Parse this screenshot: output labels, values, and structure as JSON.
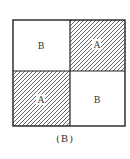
{
  "diagram": {
    "caption": "(B)",
    "cells": [
      {
        "position": "top-left",
        "label": "B",
        "hatched": false
      },
      {
        "position": "top-right",
        "label": "A",
        "hatched": true
      },
      {
        "position": "bottom-left",
        "label": "A",
        "hatched": true
      },
      {
        "position": "bottom-right",
        "label": "B",
        "hatched": false
      }
    ],
    "colors": {
      "stroke": "#222222",
      "hatch": "#555555",
      "background": "#ffffff"
    }
  }
}
